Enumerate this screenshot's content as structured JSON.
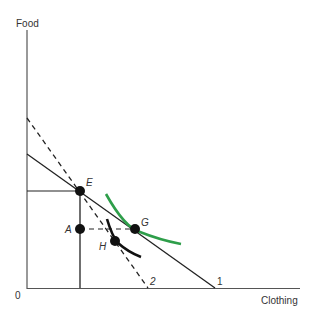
{
  "axes": {
    "y_label": "Food",
    "x_label": "Clothing",
    "origin_label": "0"
  },
  "budget_lines": [
    {
      "label": "1",
      "style": "solid"
    },
    {
      "label": "2",
      "style": "dashed"
    }
  ],
  "points": {
    "E": "E",
    "A": "A",
    "G": "G",
    "H": "H"
  },
  "colors": {
    "axis": "#555555",
    "line": "#222222",
    "indifference_green": "#2e9e4a",
    "indifference_black": "#111111"
  }
}
